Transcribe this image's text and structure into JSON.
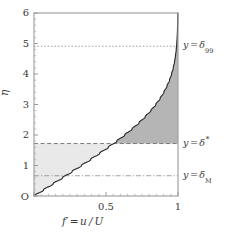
{
  "figure": {
    "kind": "blasius-boundary-layer-velocity-profile"
  },
  "axes": {
    "y_title": "η",
    "x_title_var": "f",
    "x_title_prime": "′",
    "x_title_eq": "=",
    "x_title_expr": "u / U",
    "origin_label": "O",
    "y_ticks": [
      "1",
      "2",
      "3",
      "4",
      "5",
      "6"
    ],
    "x_ticks": [
      "0.5",
      "1"
    ]
  },
  "annotations": [
    {
      "id": "delta99",
      "lhs": "y",
      "eq": "=",
      "symbol": "δ",
      "sub": "99",
      "sup": "",
      "eta": 4.91,
      "line_style": "dotted"
    },
    {
      "id": "delta-star",
      "lhs": "y",
      "eq": "=",
      "symbol": "δ",
      "sub": "",
      "sup": "∗",
      "eta": 1.72,
      "line_style": "dashed"
    },
    {
      "id": "deltaM",
      "lhs": "y",
      "eq": "=",
      "symbol": "δ",
      "sub": "M",
      "sup": "",
      "eta": 0.664,
      "line_style": "dash-dot"
    }
  ],
  "colors": {
    "frame": "#9a9a9a",
    "curve": "#2b2b2b",
    "shade_light": "#e9e9e9",
    "shade_dark": "#b5b5b5",
    "reference_line": "#8c8c8c",
    "background": "#ffffff",
    "text": "#3a3a3a"
  },
  "chart_data": {
    "type": "line",
    "title": "",
    "xlabel": "f' = u/U",
    "ylabel": "η",
    "xlim": [
      0,
      1
    ],
    "ylim": [
      0,
      6
    ],
    "grid": false,
    "legend": "none",
    "x_ticks": [
      0.5,
      1
    ],
    "y_ticks": [
      0,
      1,
      2,
      3,
      4,
      5,
      6
    ],
    "series": [
      {
        "name": "Blasius f'(η) = u/U",
        "x": [
          0.0,
          0.0664,
          0.1328,
          0.1989,
          0.2647,
          0.3298,
          0.3938,
          0.4563,
          0.5168,
          0.5748,
          0.6298,
          0.6813,
          0.729,
          0.7725,
          0.8115,
          0.846,
          0.8761,
          0.9018,
          0.9233,
          0.9411,
          0.9555,
          0.967,
          0.9759,
          0.9827,
          0.9878,
          0.9915,
          0.9942,
          0.9962,
          0.9975,
          0.9984,
          0.999,
          0.9994,
          0.9996,
          0.9998,
          0.9999,
          0.99995,
          0.99998,
          0.99999,
          1.0,
          1.0
        ],
        "y": [
          0.0,
          0.2,
          0.4,
          0.6,
          0.8,
          1.0,
          1.2,
          1.4,
          1.6,
          1.8,
          2.0,
          2.2,
          2.4,
          2.6,
          2.8,
          3.0,
          3.2,
          3.4,
          3.6,
          3.8,
          4.0,
          4.2,
          4.4,
          4.6,
          4.8,
          5.0,
          5.2,
          5.4,
          5.6,
          5.8,
          6.0,
          6.0,
          6.0,
          6.0,
          6.0,
          6.0,
          6.0,
          6.0,
          6.0,
          6.0
        ]
      }
    ],
    "reference_lines": [
      {
        "label": "y = δ₉₉",
        "eta": 4.91,
        "style": "dotted"
      },
      {
        "label": "y = δ*",
        "eta": 1.72,
        "style": "dashed"
      },
      {
        "label": "y = δ_M",
        "eta": 0.664,
        "style": "dash-dot"
      }
    ],
    "shaded_regions": [
      {
        "name": "displacement-thickness-deficit-area",
        "description": "light grey area left of the velocity profile below y = δ*",
        "color": "#e9e9e9"
      },
      {
        "name": "momentum-deficit-area",
        "description": "dark grey area right of the velocity profile above y = δ*",
        "color": "#b5b5b5"
      }
    ]
  }
}
